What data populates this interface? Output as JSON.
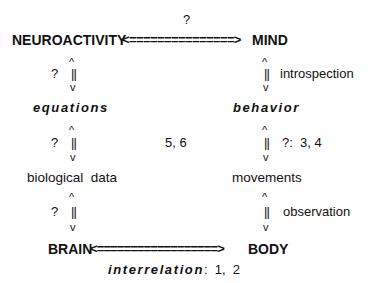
{
  "diagram": {
    "top_question": "?",
    "top_row": {
      "left": "NEUROACTIVITY",
      "arrow": "<===============>",
      "right": "MIND"
    },
    "left_column": {
      "link1": {
        "label": "?",
        "up": "^",
        "bar": "||",
        "down": "v"
      },
      "node2": "equations",
      "link2": {
        "label": "?",
        "up": "^",
        "bar": "||",
        "down": "v"
      },
      "node3": "biological  data",
      "link3": {
        "label": "?",
        "up": "^",
        "bar": "||",
        "down": "v"
      }
    },
    "right_column": {
      "link1": {
        "label": "introspection",
        "up": "^",
        "bar": "||",
        "down": "v"
      },
      "node2": "behavior",
      "link2": {
        "label": "?:  3, 4",
        "up": "^",
        "bar": "||",
        "down": "v"
      },
      "node3": "movements",
      "link3": {
        "label": "observation",
        "up": "^",
        "bar": "||",
        "down": "v"
      }
    },
    "middle_label": "5, 6",
    "bottom_row": {
      "left": "BRAIN",
      "arrow": "<==================>",
      "right": "BODY"
    },
    "bottom_caption": {
      "emph": "interrelation",
      "rest": ":  1,  2"
    }
  }
}
